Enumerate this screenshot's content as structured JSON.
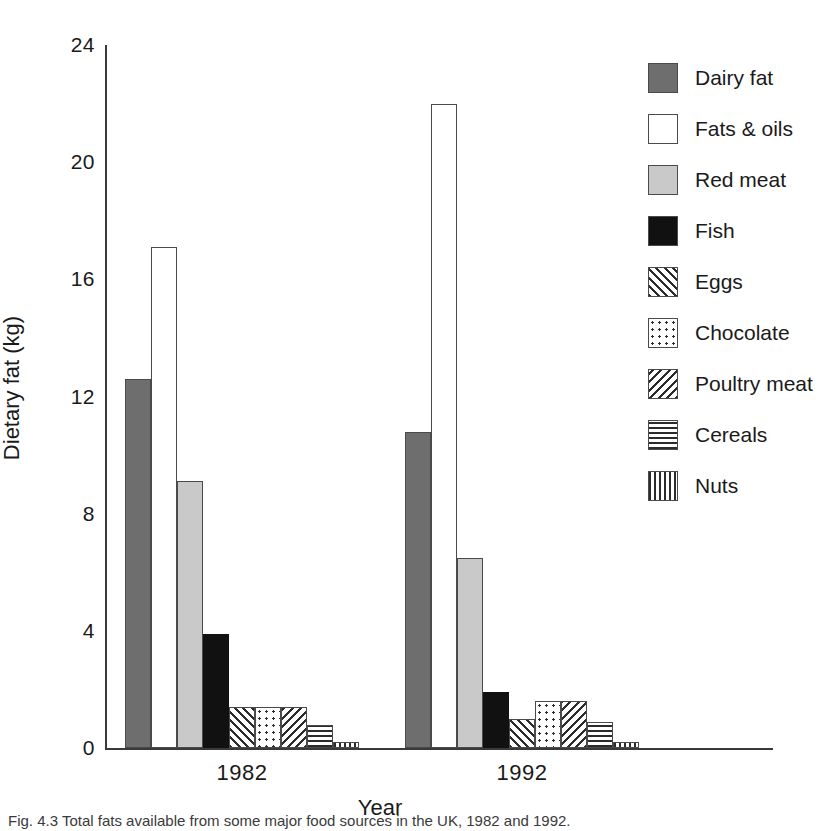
{
  "chart_data": {
    "type": "bar",
    "title": "",
    "xlabel": "Year",
    "ylabel": "Dietary fat (kg)",
    "categories": [
      "1982",
      "1992"
    ],
    "ylim": [
      0,
      24
    ],
    "yticks": [
      0,
      4,
      8,
      12,
      16,
      20,
      24
    ],
    "ytick_labels": [
      "0",
      "4",
      "8",
      "12",
      "16",
      "20",
      "24"
    ],
    "grid": false,
    "legend_position": "right",
    "series": [
      {
        "name": "Dairy fat",
        "values": [
          12.6,
          10.8
        ],
        "fill": "solid-dark",
        "color": "#6e6e6e"
      },
      {
        "name": "Fats & oils",
        "values": [
          17.1,
          22.0
        ],
        "fill": "white",
        "color": "#ffffff"
      },
      {
        "name": "Red meat",
        "values": [
          9.1,
          6.5
        ],
        "fill": "light-gray",
        "color": "#c9c9c9"
      },
      {
        "name": "Fish",
        "values": [
          3.9,
          1.9
        ],
        "fill": "black",
        "color": "#111111"
      },
      {
        "name": "Eggs",
        "values": [
          1.4,
          1.0
        ],
        "fill": "diag-up",
        "color": "#ffffff"
      },
      {
        "name": "Chocolate",
        "values": [
          1.4,
          1.6
        ],
        "fill": "dots",
        "color": "#ffffff"
      },
      {
        "name": "Poultry meat",
        "values": [
          1.4,
          1.6
        ],
        "fill": "diag-down",
        "color": "#ffffff"
      },
      {
        "name": "Cereals",
        "values": [
          0.8,
          0.9
        ],
        "fill": "horiz",
        "color": "#ffffff"
      },
      {
        "name": "Nuts",
        "values": [
          0.2,
          0.2
        ],
        "fill": "vert",
        "color": "#ffffff"
      }
    ]
  },
  "axis": {
    "y_title": "Dietary fat (kg)",
    "x_title": "Year",
    "y_labels": [
      "24",
      "20",
      "16",
      "12",
      "8",
      "4",
      "0"
    ],
    "x_labels": [
      "1982",
      "1992"
    ]
  },
  "legend": {
    "items": [
      {
        "label": "Dairy fat"
      },
      {
        "label": "Fats & oils"
      },
      {
        "label": "Red meat"
      },
      {
        "label": "Fish"
      },
      {
        "label": "Eggs"
      },
      {
        "label": "Chocolate"
      },
      {
        "label": "Poultry meat"
      },
      {
        "label": "Cereals"
      },
      {
        "label": "Nuts"
      }
    ]
  },
  "caption": {
    "text": "Fig. 4.3   Total fats available from some major food sources in the UK, 1982 and 1992."
  }
}
